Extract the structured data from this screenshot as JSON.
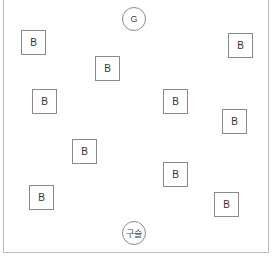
{
  "goal": {
    "label": "G",
    "x": 122,
    "y": 7
  },
  "marble": {
    "label": "구슬",
    "x": 122,
    "y": 221
  },
  "blocks": [
    {
      "label": "B",
      "x": 21,
      "y": 30
    },
    {
      "label": "B",
      "x": 95,
      "y": 56
    },
    {
      "label": "B",
      "x": 32,
      "y": 89
    },
    {
      "label": "B",
      "x": 228,
      "y": 33
    },
    {
      "label": "B",
      "x": 163,
      "y": 89
    },
    {
      "label": "B",
      "x": 222,
      "y": 109
    },
    {
      "label": "B",
      "x": 72,
      "y": 139
    },
    {
      "label": "B",
      "x": 163,
      "y": 162
    },
    {
      "label": "B",
      "x": 29,
      "y": 185
    },
    {
      "label": "B",
      "x": 214,
      "y": 192
    }
  ],
  "colors": {
    "border": "#8a8a8a",
    "frame": "#bdbdbd"
  }
}
